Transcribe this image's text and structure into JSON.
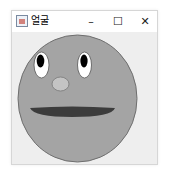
{
  "window": {
    "title": "얼굴",
    "controls": {
      "minimize": "–",
      "maximize": "☐",
      "close": "✕"
    }
  },
  "face": {
    "colors": {
      "skin": "#a4a4a4",
      "outline": "#6e6e6e",
      "eye_white": "#ffffff",
      "pupil": "#000000",
      "nose": "#c4c4c4",
      "mouth": "#3c3c3c"
    }
  }
}
